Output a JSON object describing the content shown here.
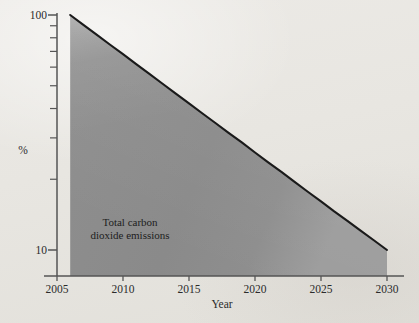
{
  "chart_data": {
    "type": "area",
    "title": "",
    "subtitle": "",
    "xlabel": "Year",
    "ylabel": "%",
    "yscale": "log",
    "xscale": "linear",
    "grid": false,
    "legend_position": "none",
    "xlim": [
      2005,
      2030
    ],
    "ylim": [
      8.5,
      100
    ],
    "x_ticks": [
      2005,
      2010,
      2015,
      2020,
      2025,
      2030
    ],
    "x_tick_labels": [
      "2005",
      "2010",
      "2015",
      "2020",
      "2025",
      "2030"
    ],
    "y_ticks": [
      10,
      20,
      30,
      40,
      50,
      60,
      70,
      80,
      90,
      100
    ],
    "y_tick_labels_shown": [
      "10",
      "100"
    ],
    "annotations": [
      {
        "text_line_1": "Total carbon",
        "text_line_2": "dioxide emissions",
        "x": 2010.5,
        "y": 17
      }
    ],
    "series": [
      {
        "name": "Total carbon dioxide emissions",
        "fill_color": "#8b8b8b",
        "line_color": "#1a1a1a",
        "x": [
          2006,
          2007,
          2008,
          2009,
          2010,
          2011,
          2012,
          2013,
          2014,
          2015,
          2016,
          2017,
          2018,
          2019,
          2020,
          2021,
          2022,
          2023,
          2024,
          2025,
          2026,
          2027,
          2028,
          2029,
          2030
        ],
        "values": [
          100.0,
          90.8,
          82.5,
          74.9,
          68.1,
          61.8,
          56.2,
          51.0,
          46.3,
          42.1,
          38.2,
          34.7,
          31.5,
          28.7,
          26.0,
          23.6,
          21.5,
          19.5,
          17.7,
          16.1,
          14.6,
          13.3,
          12.1,
          11.0,
          10.0
        ]
      }
    ]
  },
  "labels": {
    "y_top": "100",
    "y_bottom": "10",
    "y_axis_title": "%",
    "x_axis_title": "Year",
    "x_2005": "2005",
    "x_2010": "2010",
    "x_2015": "2015",
    "x_2020": "2020",
    "x_2025": "2025",
    "x_2030": "2030",
    "annotation_line1": "Total carbon",
    "annotation_line2": "dioxide emissions"
  },
  "colors": {
    "background": "#e9e7e3",
    "area_fill": "#8b8b8b",
    "curve_line": "#1a1a1a",
    "axis": "#555555",
    "text": "#2b2b2b"
  }
}
